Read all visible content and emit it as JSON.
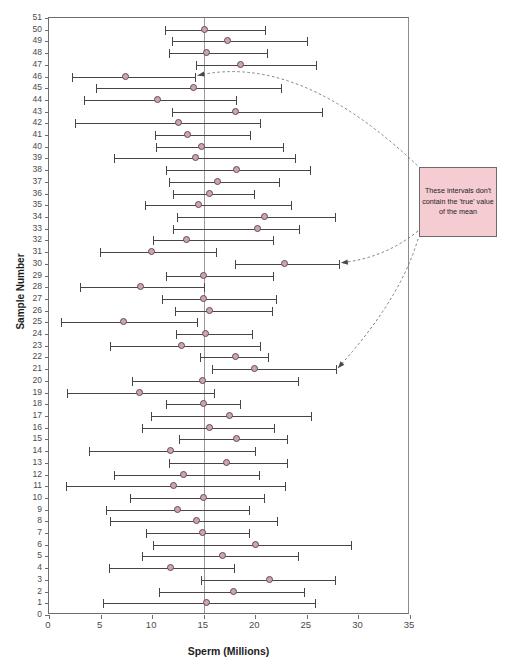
{
  "chart_data": {
    "type": "scatter",
    "title": "",
    "xlabel": "Sperm (Millions)",
    "ylabel": "Sample Number",
    "xlim": [
      0,
      35
    ],
    "ylim": [
      0,
      51
    ],
    "xticks": [
      0,
      5,
      10,
      15,
      20,
      25,
      30,
      35
    ],
    "yticks": [
      0,
      1,
      2,
      3,
      4,
      5,
      6,
      7,
      8,
      9,
      10,
      11,
      12,
      13,
      14,
      15,
      16,
      17,
      18,
      19,
      20,
      21,
      22,
      23,
      24,
      25,
      26,
      27,
      28,
      29,
      30,
      31,
      32,
      33,
      34,
      35,
      36,
      37,
      38,
      39,
      40,
      41,
      42,
      43,
      44,
      45,
      46,
      47,
      48,
      49,
      50,
      51
    ],
    "grid": false,
    "legend": null,
    "reference_line": {
      "value": 15,
      "orientation": "vertical",
      "label": "true mean",
      "color": "#9a9a9a"
    },
    "marker_color": "#cfa5ad",
    "marker_edge_color": "#5f4b50",
    "interval_color": "#4a4348",
    "series_name": "95% confidence intervals",
    "points": [
      {
        "sample": 50,
        "mean": 15.1,
        "lower": 11.2,
        "upper": 21.0,
        "contains_true": true
      },
      {
        "sample": 49,
        "mean": 17.3,
        "lower": 11.9,
        "upper": 25.1,
        "contains_true": true
      },
      {
        "sample": 48,
        "mean": 15.3,
        "lower": 11.6,
        "upper": 21.2,
        "contains_true": true
      },
      {
        "sample": 47,
        "mean": 18.6,
        "lower": 14.3,
        "upper": 26.0,
        "contains_true": true
      },
      {
        "sample": 46,
        "mean": 7.4,
        "lower": 2.2,
        "upper": 14.3,
        "contains_true": false
      },
      {
        "sample": 45,
        "mean": 14.0,
        "lower": 4.6,
        "upper": 22.6,
        "contains_true": true
      },
      {
        "sample": 44,
        "mean": 10.5,
        "lower": 3.4,
        "upper": 18.2,
        "contains_true": true
      },
      {
        "sample": 43,
        "mean": 18.1,
        "lower": 11.9,
        "upper": 26.6,
        "contains_true": true
      },
      {
        "sample": 42,
        "mean": 12.6,
        "lower": 2.5,
        "upper": 20.6,
        "contains_true": true
      },
      {
        "sample": 41,
        "mean": 13.4,
        "lower": 10.3,
        "upper": 19.6,
        "contains_true": true
      },
      {
        "sample": 40,
        "mean": 14.8,
        "lower": 10.4,
        "upper": 22.8,
        "contains_true": true
      },
      {
        "sample": 39,
        "mean": 14.2,
        "lower": 6.3,
        "upper": 23.9,
        "contains_true": true
      },
      {
        "sample": 38,
        "mean": 18.2,
        "lower": 11.3,
        "upper": 25.4,
        "contains_true": true
      },
      {
        "sample": 37,
        "mean": 16.3,
        "lower": 11.6,
        "upper": 22.4,
        "contains_true": true
      },
      {
        "sample": 36,
        "mean": 15.6,
        "lower": 12.0,
        "upper": 20.0,
        "contains_true": true
      },
      {
        "sample": 35,
        "mean": 14.5,
        "lower": 9.3,
        "upper": 23.6,
        "contains_true": true
      },
      {
        "sample": 34,
        "mean": 20.9,
        "lower": 12.4,
        "upper": 27.8,
        "contains_true": true
      },
      {
        "sample": 33,
        "mean": 20.2,
        "lower": 12.0,
        "upper": 24.3,
        "contains_true": true
      },
      {
        "sample": 32,
        "mean": 13.3,
        "lower": 10.1,
        "upper": 21.8,
        "contains_true": true
      },
      {
        "sample": 31,
        "mean": 9.9,
        "lower": 4.9,
        "upper": 16.3,
        "contains_true": true
      },
      {
        "sample": 30,
        "mean": 22.8,
        "lower": 18.0,
        "upper": 28.2,
        "contains_true": false
      },
      {
        "sample": 29,
        "mean": 15.0,
        "lower": 11.3,
        "upper": 21.8,
        "contains_true": true
      },
      {
        "sample": 28,
        "mean": 8.9,
        "lower": 3.0,
        "upper": 15.1,
        "contains_true": true
      },
      {
        "sample": 27,
        "mean": 15.0,
        "lower": 11.0,
        "upper": 22.1,
        "contains_true": true
      },
      {
        "sample": 26,
        "mean": 15.6,
        "lower": 12.2,
        "upper": 21.7,
        "contains_true": true
      },
      {
        "sample": 25,
        "mean": 7.2,
        "lower": 1.2,
        "upper": 14.4,
        "contains_true": true
      },
      {
        "sample": 24,
        "mean": 15.2,
        "lower": 12.3,
        "upper": 19.8,
        "contains_true": true
      },
      {
        "sample": 23,
        "mean": 12.8,
        "lower": 5.9,
        "upper": 20.6,
        "contains_true": true
      },
      {
        "sample": 22,
        "mean": 18.1,
        "lower": 14.6,
        "upper": 21.3,
        "contains_true": true
      },
      {
        "sample": 21,
        "mean": 19.9,
        "lower": 15.8,
        "upper": 27.9,
        "contains_true": false
      },
      {
        "sample": 20,
        "mean": 14.9,
        "lower": 8.0,
        "upper": 24.2,
        "contains_true": true
      },
      {
        "sample": 19,
        "mean": 8.8,
        "lower": 1.7,
        "upper": 16.1,
        "contains_true": true
      },
      {
        "sample": 18,
        "mean": 15.0,
        "lower": 11.3,
        "upper": 18.6,
        "contains_true": true
      },
      {
        "sample": 17,
        "mean": 17.5,
        "lower": 9.9,
        "upper": 25.5,
        "contains_true": true
      },
      {
        "sample": 16,
        "mean": 15.6,
        "lower": 9.0,
        "upper": 21.9,
        "contains_true": true
      },
      {
        "sample": 15,
        "mean": 18.2,
        "lower": 12.6,
        "upper": 23.2,
        "contains_true": true
      },
      {
        "sample": 14,
        "mean": 11.8,
        "lower": 3.9,
        "upper": 20.1,
        "contains_true": true
      },
      {
        "sample": 13,
        "mean": 17.2,
        "lower": 11.6,
        "upper": 23.2,
        "contains_true": true
      },
      {
        "sample": 12,
        "mean": 13.0,
        "lower": 6.3,
        "upper": 20.5,
        "contains_true": true
      },
      {
        "sample": 11,
        "mean": 12.1,
        "lower": 1.6,
        "upper": 23.0,
        "contains_true": true
      },
      {
        "sample": 10,
        "mean": 15.0,
        "lower": 7.9,
        "upper": 20.9,
        "contains_true": true
      },
      {
        "sample": 9,
        "mean": 12.5,
        "lower": 5.5,
        "upper": 19.5,
        "contains_true": true
      },
      {
        "sample": 8,
        "mean": 14.3,
        "lower": 5.9,
        "upper": 22.2,
        "contains_true": true
      },
      {
        "sample": 7,
        "mean": 14.9,
        "lower": 9.4,
        "upper": 19.5,
        "contains_true": true
      },
      {
        "sample": 6,
        "mean": 20.0,
        "lower": 10.1,
        "upper": 29.4,
        "contains_true": true
      },
      {
        "sample": 5,
        "mean": 16.8,
        "lower": 9.0,
        "upper": 24.2,
        "contains_true": true
      },
      {
        "sample": 4,
        "mean": 11.8,
        "lower": 5.8,
        "upper": 18.0,
        "contains_true": true
      },
      {
        "sample": 3,
        "mean": 21.4,
        "lower": 14.7,
        "upper": 27.8,
        "contains_true": true
      },
      {
        "sample": 2,
        "mean": 17.9,
        "lower": 10.7,
        "upper": 24.8,
        "contains_true": true
      },
      {
        "sample": 1,
        "mean": 15.3,
        "lower": 5.2,
        "upper": 25.9,
        "contains_true": true
      }
    ]
  },
  "annotation": {
    "text": "These intervals don't contain the 'true' value of the mean",
    "background_color": "#f5ccd1",
    "border_color": "#6b6b6b",
    "points_to_samples": [
      46,
      30,
      21
    ]
  }
}
